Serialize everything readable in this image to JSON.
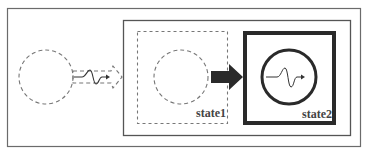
{
  "diagram": {
    "states": [
      {
        "id": "state1",
        "label": "state1",
        "style": "dashed"
      },
      {
        "id": "state2",
        "label": "state2",
        "style": "bold"
      }
    ],
    "colors": {
      "frame": "#6b6b6b",
      "dashed": "#777777",
      "bold": "#2a2a2a",
      "arrow": "#2a2a2a",
      "text": "#444444"
    },
    "icons": {
      "waveform": "signal-pulse-icon",
      "transition_arrow": "thick-right-arrow-icon"
    }
  }
}
